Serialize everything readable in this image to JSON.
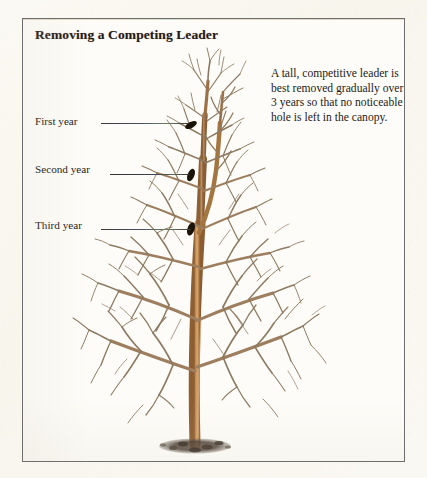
{
  "page": {
    "background_color": "#faf7f0",
    "panel_background": "#fdfcf8",
    "panel_border_color": "#6e6e6e"
  },
  "title": "Removing a Competing Leader",
  "blurb": "A tall, competitive leader is best removed gradually over 3 years so that no noticeable hole is left in the canopy.",
  "callouts": [
    {
      "label": "First year",
      "id": "first-year"
    },
    {
      "label": "Second year",
      "id": "second-year"
    },
    {
      "label": "Third year",
      "id": "third-year"
    }
  ],
  "illustration": {
    "subject": "bare deciduous tree with competing leader",
    "trunk_color": "#b8824a",
    "branch_color": "#9d7e5e",
    "twig_color": "#8d7a62",
    "mulch_color": "#4b4034",
    "cut_mark_color": "#191308",
    "cut_marks": 3
  }
}
